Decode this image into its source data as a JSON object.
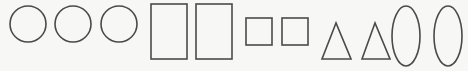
{
  "diagram": {
    "stroke_color": "#4a4a4a",
    "background": "#f7f7f5",
    "shapes": {
      "circles": [
        {
          "cx": 28,
          "cy": 24,
          "r": 18
        },
        {
          "cx": 73,
          "cy": 24,
          "r": 18
        },
        {
          "cx": 119,
          "cy": 24,
          "r": 18
        }
      ],
      "rectangles": [
        {
          "x": 151,
          "y": 4,
          "w": 36,
          "h": 55
        },
        {
          "x": 196,
          "y": 4,
          "w": 36,
          "h": 55
        }
      ],
      "squares": [
        {
          "x": 246,
          "y": 18,
          "w": 26,
          "h": 27
        },
        {
          "x": 282,
          "y": 18,
          "w": 26,
          "h": 27
        }
      ],
      "triangles": [
        {
          "points": "336,23 322,59 351,59"
        },
        {
          "points": "375,23 362,59 390,59"
        }
      ],
      "ellipses": [
        {
          "cx": 406,
          "cy": 36,
          "rx": 14,
          "ry": 30
        },
        {
          "cx": 448,
          "cy": 36,
          "rx": 14,
          "ry": 30
        }
      ]
    },
    "counts": {
      "circles": 3,
      "rectangles": 2,
      "squares": 2,
      "triangles": 2,
      "ellipses": 2
    }
  }
}
